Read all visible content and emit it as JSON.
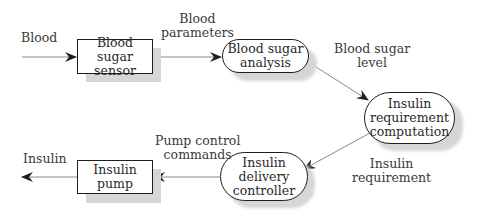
{
  "diagram": {
    "type": "data-flow",
    "nodes": {
      "sensor": {
        "lines": [
          "Blood sugar",
          "sensor"
        ],
        "shape": "rectangle"
      },
      "analysis": {
        "lines": [
          "Blood sugar",
          "analysis"
        ],
        "shape": "rounded"
      },
      "computation": {
        "lines": [
          "Insulin",
          "requirement",
          "computation"
        ],
        "shape": "rounded"
      },
      "controller": {
        "lines": [
          "Insulin",
          "delivery",
          "controller"
        ],
        "shape": "rounded"
      },
      "pump": {
        "lines": [
          "Insulin",
          "pump"
        ],
        "shape": "rectangle"
      }
    },
    "flows": {
      "blood_in": {
        "lines": [
          "Blood"
        ]
      },
      "parameters": {
        "lines": [
          "Blood",
          "parameters"
        ]
      },
      "sugar_level": {
        "lines": [
          "Blood sugar",
          "level"
        ]
      },
      "requirement": {
        "lines": [
          "Insulin",
          "requirement"
        ]
      },
      "pump_commands": {
        "lines": [
          "Pump control",
          "commands"
        ]
      },
      "insulin_out": {
        "lines": [
          "Insulin"
        ]
      }
    },
    "edges": [
      {
        "from": "input",
        "to": "sensor",
        "label": "Blood"
      },
      {
        "from": "sensor",
        "to": "analysis",
        "label": "Blood parameters"
      },
      {
        "from": "analysis",
        "to": "computation",
        "label": "Blood sugar level"
      },
      {
        "from": "computation",
        "to": "controller",
        "label": "Insulin requirement"
      },
      {
        "from": "controller",
        "to": "pump",
        "label": "Pump control commands"
      },
      {
        "from": "pump",
        "to": "output",
        "label": "Insulin"
      }
    ],
    "colors": {
      "stroke": "#1e1e1e",
      "arrow_line": "#8a8a8a",
      "shadow": "#d6d6d6",
      "text": "#2a2a2a"
    }
  }
}
